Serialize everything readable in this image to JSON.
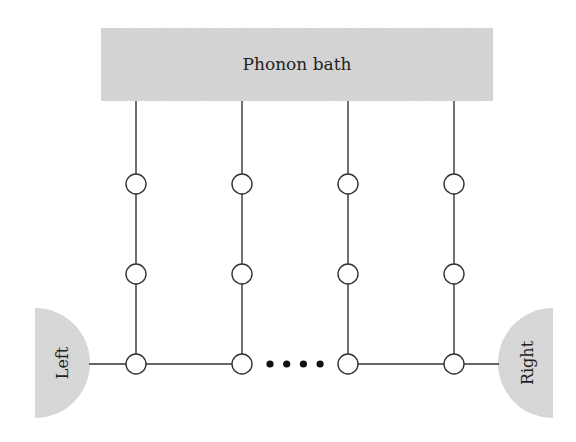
{
  "diagram": {
    "bath": {
      "label": "Phonon bath",
      "fill": "#d6d6d6"
    },
    "left_lead": {
      "label": "Left",
      "fill": "#d9d9d9"
    },
    "right_lead": {
      "label": "Right",
      "fill": "#d9d9d9"
    },
    "columns": 4,
    "nodes_per_column": 3,
    "ellipsis_dots": 4,
    "line_color": "#333333",
    "node_fill": "#ffffff"
  }
}
